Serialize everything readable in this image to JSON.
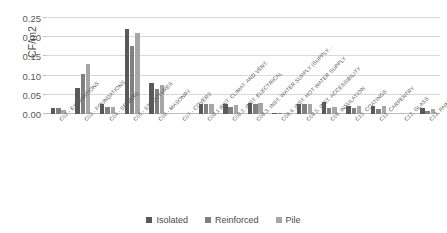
{
  "chart_data": {
    "type": "bar",
    "title": "",
    "xlabel": "",
    "ylabel": "CF/m2",
    "ylim": [
      0,
      0.25
    ],
    "yticks": [
      "0.00",
      "0.05",
      "0.10",
      "0.15",
      "0.20",
      "0.25"
    ],
    "ytick_values": [
      0.0,
      0.05,
      0.1,
      0.15,
      0.2,
      0.25
    ],
    "grid": true,
    "legend_position": "bottom",
    "categories": [
      "C02.- EXCAVATIONS",
      "C03.- FOUNDATIONS",
      "C04.- SEWERS",
      "C05.- STRUCTURES",
      "C06.- MASONRY",
      "C07.- COVERS",
      "C08.1 INST. CLIMAT. AND VENT.",
      "C08.2. INST. ELECTRICAL",
      "C08.3. INST. WATER SUPPLY (SUPPLY...",
      "C08.4. INST. HOT WATER SUPPLY",
      "C08.5. INST. ACCESSIBILITY",
      "C09. INSULATION",
      "C10. COATINGS",
      "C11. CARPENTRY",
      "C12. GLASS",
      "C13. PAINT"
    ],
    "series": [
      {
        "name": "Isolated",
        "color": "#595959",
        "values": [
          0.015,
          0.069,
          0.026,
          0.221,
          0.08,
          0.0,
          0.025,
          0.025,
          0.029,
          0.003,
          0.026,
          0.03,
          0.02,
          0.021,
          0.0,
          0.015
        ]
      },
      {
        "name": "Reinforced",
        "color": "#808080",
        "values": [
          0.016,
          0.105,
          0.019,
          0.176,
          0.065,
          0.0,
          0.025,
          0.017,
          0.027,
          0.003,
          0.026,
          0.015,
          0.015,
          0.013,
          0.0,
          0.009
        ]
      },
      {
        "name": "Pile",
        "color": "#a6a6a6",
        "values": [
          0.011,
          0.13,
          0.019,
          0.212,
          0.075,
          0.0,
          0.025,
          0.024,
          0.028,
          0.003,
          0.026,
          0.017,
          0.021,
          0.02,
          0.0,
          0.012
        ]
      }
    ]
  },
  "legend": {
    "items": [
      {
        "label": "Isolated"
      },
      {
        "label": "Reinforced"
      },
      {
        "label": "Pile"
      }
    ]
  },
  "colors": {
    "series_1": "#595959",
    "series_2": "#808080",
    "series_3": "#a6a6a6",
    "grid": "#d9d9d9",
    "text": "#595959",
    "background": "#ffffff"
  }
}
